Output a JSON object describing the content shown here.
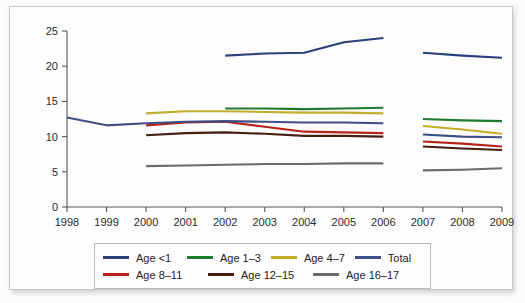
{
  "chart_data": {
    "type": "line",
    "title": "",
    "xlabel": "",
    "ylabel": "",
    "x": [
      1998,
      1999,
      2000,
      2001,
      2002,
      2003,
      2004,
      2005,
      2006,
      2007,
      2008,
      2009
    ],
    "xtick_labels": [
      "1998",
      "1999",
      "2000",
      "2001",
      "2002",
      "2003",
      "2004",
      "2005",
      "2006",
      "2007",
      "2008",
      "2009"
    ],
    "ytick_labels": [
      "0",
      "5",
      "10",
      "15",
      "20",
      "25"
    ],
    "yticks": [
      0,
      5,
      10,
      15,
      20,
      25
    ],
    "ylim": [
      0,
      25
    ],
    "grid": false,
    "legend_position": "bottom",
    "series": [
      {
        "name": "Age <1",
        "color": "#2b3f7a",
        "x": [
          2002,
          2003,
          2004,
          2005,
          2006,
          2007,
          2008,
          2009
        ],
        "values": [
          21.5,
          21.8,
          21.9,
          23.4,
          24.0,
          21.9,
          21.5,
          21.2
        ],
        "segments": [
          [
            2002,
            2003,
            2004,
            2005,
            2006
          ],
          [
            2007,
            2008,
            2009
          ]
        ]
      },
      {
        "name": "Age 1-3",
        "color": "#1f7a2e",
        "x": [
          2002,
          2003,
          2004,
          2005,
          2006,
          2007,
          2008,
          2009
        ],
        "values": [
          14.0,
          14.0,
          13.9,
          14.0,
          14.1,
          12.5,
          12.3,
          12.2
        ],
        "segments": [
          [
            2002,
            2003,
            2004,
            2005,
            2006
          ],
          [
            2007,
            2008,
            2009
          ]
        ]
      },
      {
        "name": "Age 4-7",
        "color": "#c2ad2a",
        "x": [
          2000,
          2001,
          2002,
          2003,
          2004,
          2005,
          2006,
          2007,
          2008,
          2009
        ],
        "values": [
          13.3,
          13.6,
          13.6,
          13.5,
          13.4,
          13.4,
          13.3,
          11.5,
          11.0,
          10.4
        ],
        "segments": [
          [
            2000,
            2001,
            2002,
            2003,
            2004,
            2005,
            2006
          ],
          [
            2007,
            2008,
            2009
          ]
        ]
      },
      {
        "name": "Total",
        "color": "#3f4f86",
        "x": [
          1998,
          1999,
          2000,
          2001,
          2002,
          2003,
          2004,
          2005,
          2006,
          2007,
          2008,
          2009
        ],
        "values": [
          12.7,
          11.6,
          11.9,
          12.1,
          12.2,
          12.1,
          12.0,
          12.0,
          11.9,
          10.3,
          10.0,
          9.9
        ],
        "segments": [
          [
            1998,
            1999,
            2000,
            2001,
            2002,
            2003,
            2004,
            2005,
            2006
          ],
          [
            2007,
            2008,
            2009
          ]
        ]
      },
      {
        "name": "Age 8-11",
        "color": "#b52316",
        "x": [
          2000,
          2001,
          2002,
          2003,
          2004,
          2005,
          2006,
          2007,
          2008,
          2009
        ],
        "values": [
          11.6,
          12.0,
          12.1,
          11.4,
          10.7,
          10.6,
          10.5,
          9.3,
          9.0,
          8.6
        ],
        "segments": [
          [
            2000,
            2001,
            2002,
            2003,
            2004,
            2005,
            2006
          ],
          [
            2007,
            2008,
            2009
          ]
        ]
      },
      {
        "name": "Age 12-15",
        "color": "#451e10",
        "x": [
          2000,
          2001,
          2002,
          2003,
          2004,
          2005,
          2006,
          2007,
          2008,
          2009
        ],
        "values": [
          10.2,
          10.5,
          10.6,
          10.4,
          10.1,
          10.1,
          10.0,
          8.6,
          8.3,
          8.1
        ],
        "segments": [
          [
            2000,
            2001,
            2002,
            2003,
            2004,
            2005,
            2006
          ],
          [
            2007,
            2008,
            2009
          ]
        ]
      },
      {
        "name": "Age 16-17",
        "color": "#6b6b6b",
        "x": [
          2000,
          2001,
          2002,
          2003,
          2004,
          2005,
          2006,
          2007,
          2008,
          2009
        ],
        "values": [
          5.8,
          5.9,
          6.0,
          6.1,
          6.1,
          6.2,
          6.2,
          5.2,
          5.3,
          5.5
        ],
        "segments": [
          [
            2000,
            2001,
            2002,
            2003,
            2004,
            2005,
            2006
          ],
          [
            2007,
            2008,
            2009
          ]
        ]
      }
    ]
  },
  "legend": {
    "rows": [
      [
        {
          "label": "Age <1",
          "color": "#2b3f7a"
        },
        {
          "label": "Age 1–3",
          "color": "#1f7a2e"
        },
        {
          "label": "Age 4–7",
          "color": "#c2ad2a"
        },
        {
          "label": "Total",
          "color": "#3f4f86"
        }
      ],
      [
        {
          "label": "Age 8–11",
          "color": "#b52316"
        },
        {
          "label": "Age 12–15",
          "color": "#451e10"
        },
        {
          "label": "Age 16–17",
          "color": "#6b6b6b"
        }
      ]
    ]
  }
}
